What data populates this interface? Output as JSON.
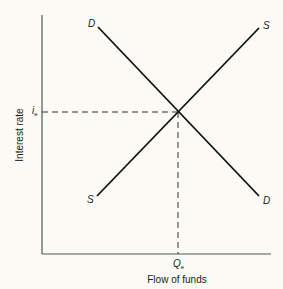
{
  "diagram": {
    "type": "supply-demand",
    "x_axis_label": "Flow of funds",
    "y_axis_label": "Interest rate",
    "equilibrium": {
      "y_symbol": "i",
      "y_subscript": "e",
      "x_symbol": "Q",
      "x_subscript": "e"
    },
    "curves": {
      "demand": {
        "top_label": "D",
        "bottom_label": "D"
      },
      "supply": {
        "top_label": "S",
        "bottom_label": "S"
      }
    },
    "colors": {
      "line": "#111111",
      "background": "#fbfaf5"
    }
  }
}
